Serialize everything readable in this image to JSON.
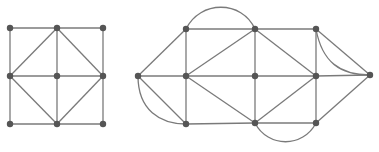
{
  "colors": {
    "edge": "#7a7a7a",
    "vertex": "#555555",
    "background": "#ffffff"
  },
  "graphs": [
    {
      "name": "left-graph",
      "vertices": [
        [
          10,
          28
        ],
        [
          57,
          28
        ],
        [
          103,
          28
        ],
        [
          10,
          76
        ],
        [
          57,
          76
        ],
        [
          103,
          76
        ],
        [
          10,
          124
        ],
        [
          57,
          124
        ],
        [
          103,
          124
        ]
      ],
      "edges": [
        [
          0,
          1
        ],
        [
          1,
          2
        ],
        [
          3,
          4
        ],
        [
          4,
          5
        ],
        [
          6,
          7
        ],
        [
          7,
          8
        ],
        [
          0,
          3
        ],
        [
          3,
          6
        ],
        [
          1,
          4
        ],
        [
          4,
          7
        ],
        [
          2,
          5
        ],
        [
          5,
          8
        ],
        [
          1,
          3
        ],
        [
          1,
          5
        ],
        [
          3,
          7
        ],
        [
          5,
          7
        ]
      ],
      "curves": []
    },
    {
      "name": "right-graph",
      "vertices": [
        [
          138,
          76
        ],
        [
          186,
          29
        ],
        [
          186,
          76
        ],
        [
          186,
          124
        ],
        [
          255,
          29
        ],
        [
          255,
          76
        ],
        [
          255,
          123
        ],
        [
          316,
          29
        ],
        [
          316,
          76
        ],
        [
          316,
          123
        ],
        [
          370,
          75
        ]
      ],
      "edges": [
        [
          0,
          1
        ],
        [
          0,
          2
        ],
        [
          0,
          3
        ],
        [
          1,
          4
        ],
        [
          2,
          5
        ],
        [
          3,
          6
        ],
        [
          4,
          7
        ],
        [
          5,
          8
        ],
        [
          6,
          9
        ],
        [
          1,
          2
        ],
        [
          2,
          3
        ],
        [
          4,
          5
        ],
        [
          5,
          6
        ],
        [
          7,
          8
        ],
        [
          8,
          9
        ],
        [
          2,
          4
        ],
        [
          2,
          6
        ],
        [
          4,
          8
        ],
        [
          6,
          8
        ],
        [
          7,
          10
        ],
        [
          8,
          10
        ],
        [
          9,
          10
        ]
      ],
      "curves": [
        "M186,29 C200,0 242,0 255,29",
        "M255,123 C268,148 303,148 316,123",
        "M138,76 C138,110 160,124 186,124",
        "M316,29 C322,62 340,75 370,75"
      ]
    }
  ]
}
